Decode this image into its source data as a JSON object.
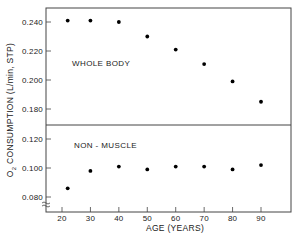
{
  "chart_data": {
    "type": "scatter",
    "title": "",
    "xlabel": "AGE (YEARS)",
    "ylabel": "O2 CONSUMPTION (L/min, STP)",
    "ylabel_parts": {
      "o": "O",
      "sub": "2",
      "rest": " CONSUMPTION (L/min, STP)"
    },
    "x_ticks": [
      20,
      30,
      40,
      50,
      60,
      70,
      80,
      90
    ],
    "x_tick_labels": [
      "20",
      "30",
      "40",
      "50",
      "60",
      "70",
      "80",
      "90"
    ],
    "xlim": [
      15,
      100
    ],
    "grid": false,
    "legend": null,
    "panels": [
      {
        "name": "WHOLE BODY",
        "label": "WHOLE BODY",
        "ylim": [
          0.17,
          0.25
        ],
        "y_ticks": [
          0.24,
          0.22,
          0.2,
          0.18
        ],
        "y_tick_labels": [
          "0.240",
          "0.220",
          "0.200",
          "0.180"
        ],
        "x": [
          22,
          30,
          40,
          50,
          60,
          70,
          80,
          90
        ],
        "values": [
          0.241,
          0.241,
          0.24,
          0.23,
          0.221,
          0.211,
          0.199,
          0.185
        ]
      },
      {
        "name": "NON-MUSCLE",
        "label": "NON - MUSCLE",
        "ylim": [
          0.072,
          0.13
        ],
        "y_ticks": [
          0.12,
          0.1,
          0.08
        ],
        "y_tick_labels": [
          "0.120",
          "0.100",
          "0.080"
        ],
        "x": [
          22,
          30,
          40,
          50,
          60,
          70,
          80,
          90
        ],
        "values": [
          0.086,
          0.098,
          0.101,
          0.099,
          0.101,
          0.101,
          0.099,
          0.102
        ]
      }
    ],
    "axis_break": "bottom of y-axis (≈ symbol)"
  }
}
